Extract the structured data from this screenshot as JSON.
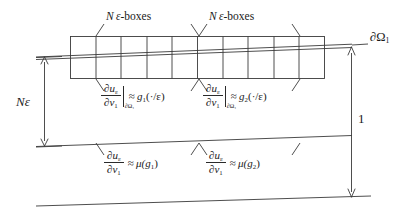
{
  "figure": {
    "stroke_color": "#3a3a3a",
    "text_color": "#1a1a1a",
    "grid": {
      "columns": 10,
      "rows": 1,
      "left": 70,
      "right": 325,
      "top": 36,
      "bottom": 78
    }
  },
  "labels": {
    "boxes_left": {
      "n": "N",
      "eps": "ε",
      "suffix": "-boxes"
    },
    "boxes_right": {
      "n": "N",
      "eps": "ε",
      "suffix": "-boxes"
    },
    "n_epsilon": "Nε",
    "boundary": "∂Ω",
    "boundary_sub": "1",
    "unit_height": "1"
  },
  "formulas": {
    "upper_left": {
      "num": "∂u",
      "num_sub": "ε",
      "den": "∂ν",
      "den_sub": "1",
      "restriction": "∂Ω₁",
      "rel": "≈",
      "rhs_fn": "g",
      "rhs_sub": "1",
      "rhs_arg": "(·/ε)"
    },
    "upper_right": {
      "num": "∂u",
      "num_sub": "ε",
      "den": "∂ν",
      "den_sub": "1",
      "restriction": "∂Ω₁",
      "rel": "≈",
      "rhs_fn": "g",
      "rhs_sub": "2",
      "rhs_arg": "(·/ε)"
    },
    "lower_left": {
      "num": "∂u",
      "num_sub": "ε",
      "den": "∂ν",
      "den_sub": "1",
      "rel": "≈",
      "rhs_fn": "μ",
      "rhs_arg_open": "(g",
      "rhs_sub": "1",
      "rhs_arg_close": ")"
    },
    "lower_right": {
      "num": "∂u",
      "num_sub": "ε",
      "den": "∂ν",
      "den_sub": "1",
      "rel": "≈",
      "rhs_fn": "μ",
      "rhs_arg_open": "(g",
      "rhs_sub": "2",
      "rhs_arg_close": ")"
    }
  }
}
